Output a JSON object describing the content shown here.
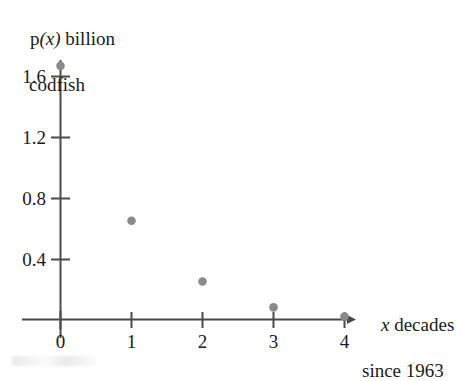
{
  "chart_data": {
    "type": "scatter",
    "title": "",
    "xlabel": "x decades since 1963",
    "ylabel": "p(x) billion codfish",
    "x": [
      0,
      1,
      2,
      3,
      4
    ],
    "values": [
      1.67,
      0.65,
      0.25,
      0.08,
      0.02
    ],
    "points": [
      {
        "x": 0,
        "y": 1.67
      },
      {
        "x": 1,
        "y": 0.65
      },
      {
        "x": 2,
        "y": 0.25
      },
      {
        "x": 3,
        "y": 0.08
      },
      {
        "x": 4,
        "y": 0.02
      }
    ],
    "xlim": [
      0,
      4
    ],
    "ylim": [
      0,
      1.8
    ],
    "xticks": [
      "0",
      "1",
      "2",
      "3",
      "4"
    ],
    "yticks": [
      "0.4",
      "0.8",
      "1.2",
      "1.6"
    ],
    "ytick_values": [
      0.4,
      0.8,
      1.2,
      1.6
    ],
    "grid": false,
    "legend": "none",
    "marker_color": "#8a8a8a",
    "axis_color": "#4a4a4a"
  },
  "ylabel": {
    "line1_prefix": "p",
    "line1_var": "(x)",
    "line1_rest": " billion",
    "line2": "codfish"
  },
  "xlabel": {
    "line1_var": "x",
    "line1_rest": " decades",
    "line2": "since 1963"
  },
  "yticks": [
    {
      "label": "1.6"
    },
    {
      "label": "1.2"
    },
    {
      "label": "0.8"
    },
    {
      "label": "0.4"
    }
  ],
  "xticks": [
    {
      "label": "0"
    },
    {
      "label": "1"
    },
    {
      "label": "2"
    },
    {
      "label": "3"
    },
    {
      "label": "4"
    }
  ]
}
